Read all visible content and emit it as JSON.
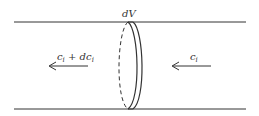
{
  "diagram": {
    "volume_label": "dV",
    "outflow_label": {
      "base": "c",
      "sub": "i",
      "plus": " + ",
      "d": "dc",
      "dsub": "i"
    },
    "inflow_label": {
      "base": "c",
      "sub": "i"
    },
    "colors": {
      "stroke": "#333333",
      "background": "#ffffff"
    }
  }
}
